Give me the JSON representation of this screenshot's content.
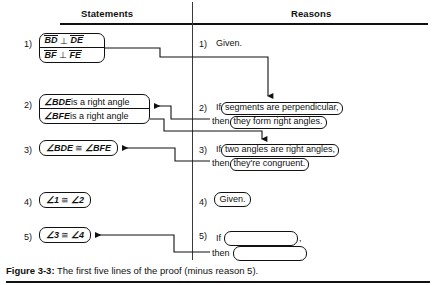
{
  "figure": {
    "caption_label": "Figure 3-3:",
    "caption_text": "The first five lines of the proof (minus reason 5).",
    "ink_color": "#111111",
    "background_color": "#ffffff"
  },
  "columns": {
    "statements_header": "Statements",
    "reasons_header": "Reasons"
  },
  "numbers": {
    "n1": "1)",
    "n2": "2)",
    "n3": "3)",
    "n4": "4)",
    "n5": "5)"
  },
  "statements": [
    {
      "number": "1)",
      "boxed": true,
      "lines": [
        "BD ⊥ DE",
        "BF ⊥ FE"
      ],
      "line1_seg1": "BD",
      "line1_op": "⊥",
      "line1_seg2": "DE",
      "line2_seg1": "BF",
      "line2_op": "⊥",
      "line2_seg2": "FE"
    },
    {
      "number": "2)",
      "boxed": true,
      "line1_angle": "∠BDE",
      "line1_rest": " is a right angle",
      "line2_angle": "∠BFE",
      "line2_rest": " is a right angle",
      "lines": [
        "∠BDE is a right angle",
        "∠BFE is a right angle"
      ]
    },
    {
      "number": "3)",
      "boxed": true,
      "text": "∠BDE ≅ ∠BFE",
      "left_angle": "∠BDE",
      "relation": "≅",
      "right_angle": "∠BFE"
    },
    {
      "number": "4)",
      "boxed": true,
      "text": "∠1 ≅ ∠2",
      "left_angle": "∠1",
      "relation": "≅",
      "right_angle": "∠2"
    },
    {
      "number": "5)",
      "boxed": true,
      "text": "∠3 ≅ ∠4",
      "left_angle": "∠3",
      "relation": "≅",
      "right_angle": "∠4"
    }
  ],
  "reasons": [
    {
      "number": "1)",
      "boxed": false,
      "text": "Given."
    },
    {
      "number": "2)",
      "if_word": "If",
      "if_clause": "segments are perpendicular,",
      "then_word": "then",
      "then_clause": "they form right angles."
    },
    {
      "number": "3)",
      "if_word": "If",
      "if_clause": "two angles are right angles,",
      "then_word": "then",
      "then_clause": "they're congruent."
    },
    {
      "number": "4)",
      "boxed": true,
      "text": "Given."
    },
    {
      "number": "5)",
      "if_word": "If",
      "if_clause": "",
      "if_suffix": ",",
      "then_word": "then",
      "then_clause": "",
      "blank": true
    }
  ]
}
